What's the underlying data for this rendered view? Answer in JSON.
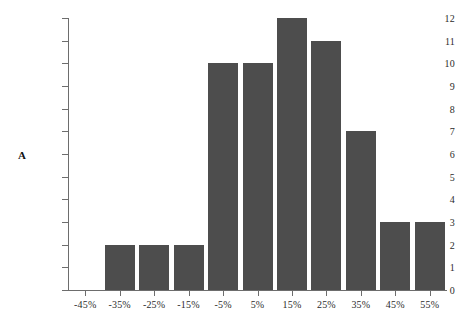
{
  "chart_data": {
    "type": "bar",
    "title": "",
    "subtitle": "",
    "xlabel": "",
    "ylabel": "A",
    "categories": [
      "-45%",
      "-35%",
      "-25%",
      "-15%",
      "-5%",
      "5%",
      "15%",
      "25%",
      "35%",
      "45%",
      "55%"
    ],
    "values": [
      0,
      2,
      2,
      2,
      10,
      10,
      12,
      11,
      7,
      3,
      3
    ],
    "ylim": [
      0,
      12
    ],
    "yticks": [
      0,
      1,
      2,
      3,
      4,
      5,
      6,
      7,
      8,
      9,
      10,
      11,
      12
    ],
    "ytick_labels": [
      "0",
      "1",
      "2",
      "3",
      "4",
      "5",
      "6",
      "7",
      "8",
      "9",
      "10",
      "11",
      "12"
    ],
    "grid": false,
    "legend": null,
    "legend_position": "none",
    "bar_color": "#4d4d4d",
    "axis_color": "#6d6d6d",
    "background_color": "#ffffff",
    "text_color": "#2b2b2b"
  },
  "axis": {
    "y_title": "A"
  }
}
